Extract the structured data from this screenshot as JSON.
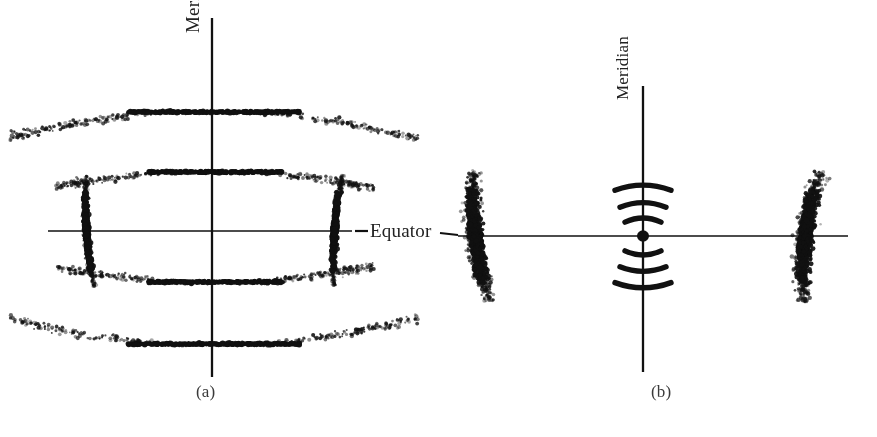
{
  "figure": {
    "type": "scientific-figure",
    "background_color": "#ffffff",
    "ink_color": "#111111"
  },
  "labels": {
    "meridian_a": "Meridian",
    "meridian_b": "Meridian",
    "equator": "Equator",
    "caption_a": "(a)",
    "caption_b": "(b)"
  },
  "chart_data": {
    "type": "scatter",
    "title": "",
    "xlabel": "Equator",
    "ylabel": "Meridian",
    "panels": [
      {
        "id": "a",
        "caption": "(a)",
        "center": [
          212,
          231
        ],
        "axes": {
          "equator": {
            "x1": 48,
            "y1": 231,
            "x2": 352,
            "y2": 231,
            "label": "Equator"
          },
          "meridian": {
            "x1": 212,
            "y1": 18,
            "x2": 212,
            "y2": 377,
            "label": "Meridian"
          }
        },
        "reflections": [
          {
            "name": "equatorial-left",
            "kind": "arc",
            "cx": 88,
            "cy": 231,
            "rx": 9,
            "ry": 56,
            "tilt": -4,
            "density": "dense"
          },
          {
            "name": "equatorial-right",
            "kind": "arc",
            "cx": 336,
            "cy": 231,
            "rx": 9,
            "ry": 56,
            "tilt": 4,
            "density": "dense"
          },
          {
            "name": "layer-line-2-up",
            "kind": "layer-line",
            "y": 112,
            "x1": 128,
            "x2": 300,
            "halo_span": 118,
            "bow": 26,
            "direction": "down"
          },
          {
            "name": "layer-line-1-up",
            "kind": "layer-line",
            "y": 172,
            "x1": 148,
            "x2": 282,
            "halo_span": 92,
            "bow": 16,
            "direction": "down"
          },
          {
            "name": "layer-line-1-down",
            "kind": "layer-line",
            "y": 282,
            "x1": 148,
            "x2": 282,
            "halo_span": 92,
            "bow": 16,
            "direction": "up"
          },
          {
            "name": "layer-line-2-down",
            "kind": "layer-line",
            "y": 344,
            "x1": 128,
            "x2": 300,
            "halo_span": 118,
            "bow": 26,
            "direction": "up"
          }
        ]
      },
      {
        "id": "b",
        "caption": "(b)",
        "center": [
          643,
          236
        ],
        "axes": {
          "equator": {
            "x1": 458,
            "y1": 236,
            "x2": 848,
            "y2": 236
          },
          "meridian": {
            "x1": 643,
            "y1": 86,
            "x2": 643,
            "y2": 372,
            "label": "Meridian"
          }
        },
        "reflections": [
          {
            "name": "equatorial-left",
            "kind": "arc",
            "cx": 478,
            "cy": 236,
            "rx": 18,
            "ry": 66,
            "tilt": -7,
            "density": "diffuse"
          },
          {
            "name": "equatorial-right",
            "kind": "arc",
            "cx": 808,
            "cy": 236,
            "rx": 18,
            "ry": 66,
            "tilt": 7,
            "density": "diffuse"
          },
          {
            "name": "meridional-arc-1-up",
            "kind": "solid-arc",
            "cy": 189,
            "width": 56,
            "bow": -9
          },
          {
            "name": "meridional-arc-2-up",
            "kind": "solid-arc",
            "cy": 206,
            "width": 46,
            "bow": -8
          },
          {
            "name": "meridional-arc-3-up",
            "kind": "solid-arc",
            "cy": 221,
            "width": 36,
            "bow": -7
          },
          {
            "name": "center-spot",
            "kind": "dot",
            "cx": 643,
            "cy": 236,
            "r": 6
          },
          {
            "name": "meridional-arc-1-down",
            "kind": "solid-arc",
            "cy": 252,
            "width": 36,
            "bow": 7
          },
          {
            "name": "meridional-arc-2-down",
            "kind": "solid-arc",
            "cy": 268,
            "width": 46,
            "bow": 8
          },
          {
            "name": "meridional-arc-3-down",
            "kind": "solid-arc",
            "cy": 284,
            "width": 56,
            "bow": 9
          }
        ]
      }
    ],
    "leader_lines": [
      {
        "name": "equator-leader-left",
        "x1": 355,
        "y1": 231,
        "x2": 368,
        "y2": 231
      },
      {
        "name": "equator-leader-right",
        "x1": 440,
        "y1": 233,
        "x2": 458,
        "y2": 235
      }
    ]
  }
}
